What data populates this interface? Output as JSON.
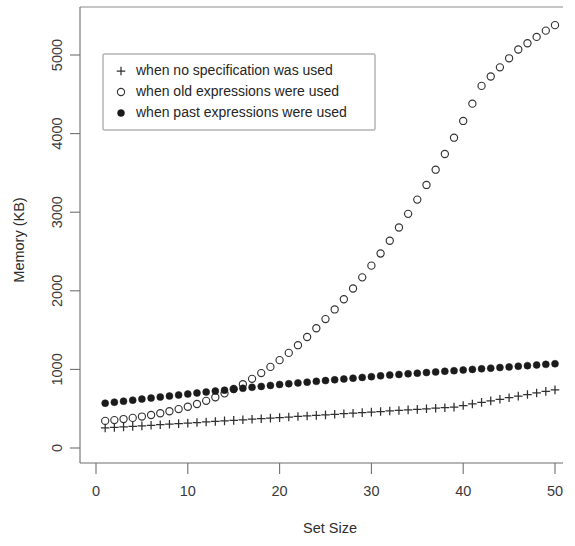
{
  "chart_data": {
    "type": "scatter",
    "title": "",
    "xlabel": "Set Size",
    "ylabel": "Memory (KB)",
    "xlim": [
      0,
      51
    ],
    "ylim": [
      0,
      5500
    ],
    "xticks": [
      0,
      10,
      20,
      30,
      40,
      50
    ],
    "yticks": [
      0,
      1000,
      2000,
      3000,
      4000,
      5000
    ],
    "grid": false,
    "legend_position": "top-left",
    "x": [
      1,
      2,
      3,
      4,
      5,
      6,
      7,
      8,
      9,
      10,
      11,
      12,
      13,
      14,
      15,
      16,
      17,
      18,
      19,
      20,
      21,
      22,
      23,
      24,
      25,
      26,
      27,
      28,
      29,
      30,
      31,
      32,
      33,
      34,
      35,
      36,
      37,
      38,
      39,
      40,
      41,
      42,
      43,
      44,
      45,
      46,
      47,
      48,
      49,
      50
    ],
    "series": [
      {
        "name": "when no specification was used",
        "marker": "plus",
        "marker_label": "+",
        "color": "#303030",
        "values": [
          255,
          262,
          268,
          275,
          282,
          289,
          296,
          303,
          310,
          317,
          324,
          331,
          338,
          345,
          352,
          359,
          366,
          373,
          380,
          387,
          394,
          401,
          408,
          415,
          422,
          429,
          436,
          443,
          450,
          457,
          464,
          471,
          478,
          485,
          492,
          499,
          506,
          513,
          520,
          540,
          560,
          580,
          600,
          620,
          640,
          660,
          680,
          700,
          720,
          740
        ]
      },
      {
        "name": "when old expressions were used",
        "marker": "open-circle",
        "marker_label": "o",
        "color": "#333333",
        "values": [
          345,
          355,
          368,
          383,
          400,
          420,
          442,
          467,
          495,
          525,
          560,
          600,
          645,
          695,
          750,
          812,
          880,
          953,
          1032,
          1118,
          1210,
          1308,
          1412,
          1523,
          1640,
          1763,
          1893,
          2029,
          2171,
          2320,
          2475,
          2637,
          2805,
          2979,
          3160,
          3347,
          3541,
          3741,
          3948,
          4161,
          4381,
          4607,
          4727,
          4843,
          4958,
          5070,
          5150,
          5230,
          5310,
          5380
        ]
      },
      {
        "name": "when past expressions were used",
        "marker": "filled-circle",
        "marker_label": "●",
        "color": "#1b1b1b",
        "values": [
          570,
          583,
          596,
          609,
          622,
          635,
          648,
          661,
          674,
          687,
          700,
          712,
          724,
          736,
          748,
          760,
          772,
          784,
          796,
          808,
          818,
          828,
          838,
          848,
          858,
          868,
          878,
          888,
          898,
          908,
          918,
          928,
          936,
          944,
          952,
          960,
          968,
          976,
          984,
          992,
          1000,
          1008,
          1016,
          1024,
          1032,
          1040,
          1048,
          1056,
          1064,
          1072
        ]
      }
    ]
  },
  "legend": {
    "entries": [
      {
        "symbol": "+",
        "label": "when no specification was used"
      },
      {
        "symbol": "o",
        "label": "when old expressions were used"
      },
      {
        "symbol": "●",
        "label": "when past expressions were used"
      }
    ]
  },
  "axes": {
    "x_title": "Set Size",
    "y_title": "Memory (KB)",
    "x_tick_labels": [
      "0",
      "10",
      "20",
      "30",
      "40",
      "50"
    ],
    "y_tick_labels": [
      "0",
      "1000",
      "2000",
      "3000",
      "4000",
      "5000"
    ]
  }
}
